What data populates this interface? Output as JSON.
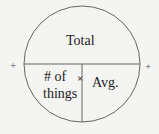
{
  "diagram": {
    "top_label": "Total",
    "bottom_left_label_line1": "# of",
    "bottom_left_label_line2": "things",
    "bottom_right_label": "Avg.",
    "operator": "×",
    "left_marker": "+",
    "right_marker": "+",
    "stroke_color": "#666666",
    "text_color": "#222222",
    "background_color": "#f4f4f2"
  }
}
